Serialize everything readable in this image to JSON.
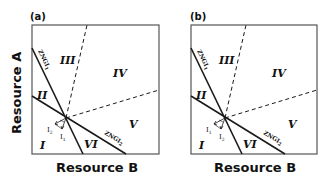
{
  "figure": {
    "x_axis_label": "Resource B",
    "y_axis_label": "Resource A",
    "colors": {
      "line": "#1a1a1a",
      "background": "#ffffff"
    }
  },
  "panels": [
    {
      "label": "(a)",
      "show_y_label": true,
      "regions": [
        "I",
        "II",
        "III",
        "IV",
        "V",
        "VI"
      ],
      "zngi_1": {
        "name": "ZNGI",
        "sub": "1"
      },
      "zngi_2": {
        "name": "ZNGI",
        "sub": "2"
      },
      "vector_upper": {
        "name": "I",
        "sub": "2"
      },
      "vector_lower": {
        "name": "I",
        "sub": "1"
      }
    },
    {
      "label": "(b)",
      "show_y_label": false,
      "regions": [
        "I",
        "II",
        "III",
        "IV",
        "V",
        "VI"
      ],
      "zngi_1": {
        "name": "ZNGI",
        "sub": "1"
      },
      "zngi_2": {
        "name": "ZNGI",
        "sub": "2"
      },
      "vector_upper": {
        "name": "I",
        "sub": "1"
      },
      "vector_lower": {
        "name": "I",
        "sub": "2"
      }
    }
  ]
}
